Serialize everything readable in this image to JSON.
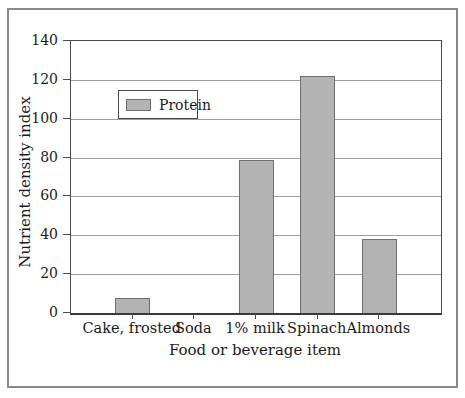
{
  "figure": {
    "background": "#ffffff",
    "outer_border_color": "#8a8a8a"
  },
  "chart_data": {
    "type": "bar",
    "title": "",
    "categories": [
      "Cake, frosted",
      "Soda",
      "1% milk",
      "Spinach",
      "Almonds"
    ],
    "series": [
      {
        "name": "Protein",
        "values": [
          8,
          0,
          79,
          122,
          38
        ]
      }
    ],
    "xlabel": "Food or beverage item",
    "ylabel": "Nutrient density index",
    "ylim": [
      0,
      140
    ],
    "yticks": [
      0,
      20,
      40,
      60,
      80,
      100,
      120,
      140
    ],
    "grid": "horizontal",
    "legend": {
      "position": "upper-left-inside",
      "entries": [
        "Protein"
      ]
    },
    "colors": {
      "bar_fill": "#b3b3b3",
      "bar_border": "#707070",
      "gridline": "#9e9e9e",
      "axis": "#4a4a4a",
      "text": "#1b1b1b"
    }
  }
}
